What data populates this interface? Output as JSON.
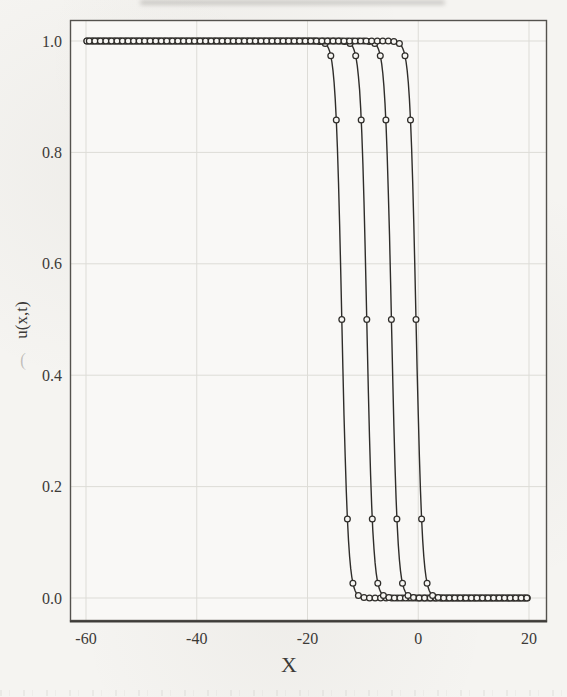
{
  "figure": {
    "kind": "scanned textbook plot of traveling wave fronts",
    "background_color": "#f5f4f1",
    "frame_color": "#54524e",
    "grid_color": "#dddcd7",
    "curve_color": "#2f2d2a",
    "marker_fill": "#f7f6f3",
    "text_color": "#3c3a37",
    "artifacts": {
      "top_smudge": "dark scan streak along top edge",
      "bleed_mark": "("
    }
  },
  "chart_data": {
    "type": "line",
    "title": "",
    "xlabel": "X",
    "ylabel": "u(x,t)",
    "xlim": [
      -63,
      24
    ],
    "ylim": [
      -0.04,
      1.04
    ],
    "x_data_range": [
      -60,
      20
    ],
    "grid": true,
    "legend": "none",
    "marker": "open-circle",
    "marker_spacing_x": 1.0,
    "x_ticks": [
      {
        "value": -60,
        "label": "-60"
      },
      {
        "value": -40,
        "label": "-40"
      },
      {
        "value": -20,
        "label": "-20"
      },
      {
        "value": 0,
        "label": "0"
      },
      {
        "value": 20,
        "label": "20"
      }
    ],
    "y_ticks": [
      {
        "value": 1.0,
        "label": "1.0"
      },
      {
        "value": 0.8,
        "label": "0.8"
      },
      {
        "value": 0.6,
        "label": "0.6"
      },
      {
        "value": 0.4,
        "label": "0.4"
      },
      {
        "value": 0.2,
        "label": "0.2"
      },
      {
        "value": 0.0,
        "label": "0.0"
      }
    ],
    "model": "u(x) = 1 / (1 + exp(k*(x - c))), plateau 1.0 on left, 0.0 on right",
    "steepness_k": 1.8,
    "series": [
      {
        "name": "wave-front t1",
        "front_center_c": -13.8,
        "points": [
          [
            -17.8,
            0.999
          ],
          [
            -16.8,
            0.996
          ],
          [
            -15.8,
            0.973
          ],
          [
            -14.8,
            0.858
          ],
          [
            -13.8,
            0.5
          ],
          [
            -12.8,
            0.142
          ],
          [
            -11.8,
            0.027
          ],
          [
            -10.8,
            0.005
          ],
          [
            -9.8,
            0.001
          ]
        ]
      },
      {
        "name": "wave-front t2",
        "front_center_c": -9.3,
        "points": [
          [
            -13.3,
            0.999
          ],
          [
            -12.3,
            0.996
          ],
          [
            -11.3,
            0.973
          ],
          [
            -10.3,
            0.858
          ],
          [
            -9.3,
            0.5
          ],
          [
            -8.3,
            0.142
          ],
          [
            -7.3,
            0.027
          ],
          [
            -6.3,
            0.005
          ],
          [
            -5.3,
            0.001
          ]
        ]
      },
      {
        "name": "wave-front t3",
        "front_center_c": -4.85,
        "points": [
          [
            -8.85,
            0.999
          ],
          [
            -7.85,
            0.996
          ],
          [
            -6.85,
            0.973
          ],
          [
            -5.85,
            0.858
          ],
          [
            -4.85,
            0.5
          ],
          [
            -3.85,
            0.142
          ],
          [
            -2.85,
            0.027
          ],
          [
            -1.85,
            0.005
          ],
          [
            -0.85,
            0.001
          ]
        ]
      },
      {
        "name": "wave-front t4",
        "front_center_c": -0.4,
        "points": [
          [
            -4.4,
            0.999
          ],
          [
            -3.4,
            0.996
          ],
          [
            -2.4,
            0.973
          ],
          [
            -1.4,
            0.858
          ],
          [
            -0.4,
            0.5
          ],
          [
            0.6,
            0.142
          ],
          [
            1.6,
            0.027
          ],
          [
            2.6,
            0.005
          ],
          [
            3.6,
            0.001
          ]
        ]
      }
    ]
  }
}
